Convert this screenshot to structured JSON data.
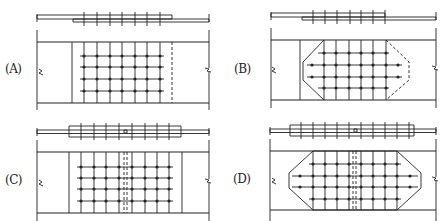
{
  "figure": {
    "colors": {
      "line": "#222222",
      "background": "#ffffff"
    },
    "panels": [
      {
        "id": "A",
        "label": "(A)",
        "plate_shape": "rectangle",
        "splice_joint": false,
        "bolt_columns": 7,
        "bolt_rows": 4,
        "far_edge": "dashed"
      },
      {
        "id": "B",
        "label": "(B)",
        "plate_shape": "hexagon-chamfered",
        "splice_joint": false,
        "bolt_columns": 7,
        "bolt_rows": 4,
        "far_edge": "dashed"
      },
      {
        "id": "C",
        "label": "(C)",
        "plate_shape": "rectangle",
        "splice_joint": true,
        "bolt_columns": 8,
        "bolt_rows": 4,
        "far_edge": "solid"
      },
      {
        "id": "D",
        "label": "(D)",
        "plate_shape": "octagon-chamfered",
        "splice_joint": true,
        "bolt_columns": 10,
        "bolt_rows": 4,
        "far_edge": "solid"
      }
    ]
  }
}
